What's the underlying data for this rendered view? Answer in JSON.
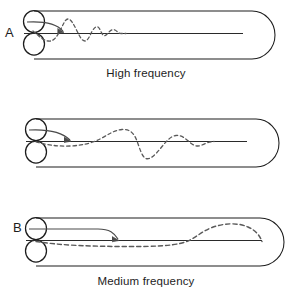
{
  "figure": {
    "background_color": "#ffffff",
    "stroke_color": "#1d1d1d",
    "dash_color": "#555555",
    "arrow_color": "#4a4a4a",
    "width": 292,
    "height": 302
  },
  "panels": [
    {
      "id": "a",
      "letter": "A",
      "caption": "High frequency",
      "source_icon": "double-coil-source-icon",
      "arrow_icon": "curved-arrow-icon",
      "wave_icon": "decaying-high-frequency-wave-icon",
      "tube_icon": "rounded-end-tube-icon",
      "axis_icon": "center-axis-line-icon",
      "wave_description": "rapid decaying oscillation near the source",
      "wave_cycles": 3.5,
      "wave_extent_px": 110,
      "wave_max_amplitude_px": 14
    },
    {
      "id": "b",
      "letter": "B",
      "caption": "Medium frequency",
      "source_icon": "double-coil-source-icon",
      "arrow_icon": "curved-arrow-icon",
      "wave_icon": "medium-frequency-wave-icon",
      "tube_icon": "rounded-end-tube-icon",
      "axis_icon": "center-axis-line-icon",
      "wave_description": "oscillation growing toward mid tube then continuing",
      "wave_cycles": 2.0,
      "wave_extent_px": 215,
      "wave_max_amplitude_px": 18
    },
    {
      "id": "c",
      "letter": "C",
      "caption": "Low frequency",
      "source_icon": "double-coil-source-icon",
      "arrow_icon": "long-curved-arrow-icon",
      "wave_icon": "low-frequency-wave-icon",
      "tube_icon": "rounded-end-tube-icon",
      "axis_icon": "center-axis-line-icon",
      "wave_description": "single long hump rising only near the closed end",
      "wave_cycles": 0.5,
      "wave_extent_px": 250,
      "wave_max_amplitude_px": 17
    }
  ]
}
